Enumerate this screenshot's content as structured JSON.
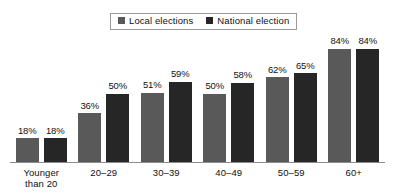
{
  "chart_data": {
    "type": "bar",
    "title": "",
    "subtitle": "",
    "xlabel": "",
    "ylabel": "",
    "ylim": [
      0,
      100
    ],
    "grid": false,
    "legend_position": "top-center",
    "value_labels_suffix": "%",
    "categories": [
      "Younger than 20",
      "20–29",
      "30–39",
      "40–49",
      "50–59",
      "60+"
    ],
    "category_lines": [
      [
        "Younger",
        "than 20"
      ],
      [
        "20–29"
      ],
      [
        "30–39"
      ],
      [
        "40–49"
      ],
      [
        "50–59"
      ],
      [
        "60+"
      ]
    ],
    "series": [
      {
        "name": "Local elections",
        "color": "#595959",
        "values": [
          18,
          36,
          51,
          50,
          62,
          84
        ],
        "labels": [
          "18%",
          "36%",
          "51%",
          "50%",
          "62%",
          "84%"
        ]
      },
      {
        "name": "National election",
        "color": "#262626",
        "values": [
          18,
          50,
          59,
          58,
          65,
          84
        ],
        "labels": [
          "18%",
          "50%",
          "59%",
          "58%",
          "65%",
          "84%"
        ]
      }
    ]
  },
  "legend": {
    "entries": [
      {
        "label": "Local elections",
        "color": "#595959"
      },
      {
        "label": "National election",
        "color": "#262626"
      }
    ]
  },
  "colors": {
    "local": "#595959",
    "national": "#262626",
    "axis": "#8d8d8d",
    "text": "#111111",
    "background": "#ffffff"
  }
}
